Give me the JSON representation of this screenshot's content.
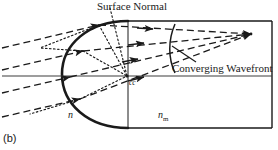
{
  "figure": {
    "panel_label": "(b)",
    "labels": {
      "surface_normal": "Surface Normal",
      "converging_wavefront": "Converging Wavefront",
      "center_of_curvature": "cc",
      "index_lens": "n",
      "index_medium_base": "n",
      "index_medium_sub": "m"
    },
    "colors": {
      "ink": "#1a1a1a",
      "background": "#ffffff",
      "axis": "#404040"
    },
    "geometry": {
      "canvas_width": 278,
      "canvas_height": 150,
      "optical_axis_y": 76,
      "body_top_y": 21,
      "body_bottom_y": 128,
      "body_right_x": 272,
      "vertex_x": 128,
      "apex_x": 62,
      "center_of_curvature": {
        "x": 127,
        "y": 76
      },
      "focal_point": {
        "x": 251,
        "y": 34
      },
      "wavefront_arc": {
        "top": {
          "x": 175,
          "y": 24
        },
        "bottom": {
          "x": 175,
          "y": 73
        }
      }
    },
    "elements": {
      "incoming_rays_count": 4,
      "refracted_rays_count": 4,
      "normal_lines_count": 3,
      "arrowheads_count": 8
    }
  }
}
